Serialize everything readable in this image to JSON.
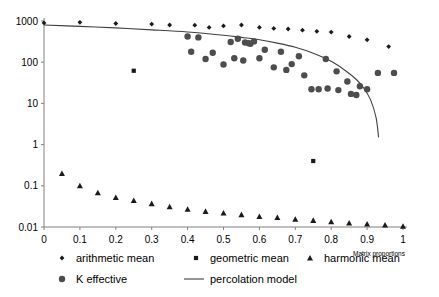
{
  "chart_data": {
    "type": "scatter",
    "title": "",
    "subtitle": "",
    "xlabel": "Matrix proportions",
    "ylabel": "",
    "xlim": [
      0,
      1
    ],
    "ylim": [
      0.01,
      1000
    ],
    "yscale": "log",
    "xscale": "linear",
    "grid": false,
    "legend_position": "bottom",
    "xticks": [
      "0",
      "0.1",
      "0.2",
      "0.3",
      "0.4",
      "0.5",
      "0.6",
      "0.7",
      "0.8",
      "0.9",
      "1"
    ],
    "xtick_values": [
      0,
      0.1,
      0.2,
      0.3,
      0.4,
      0.5,
      0.6,
      0.7,
      0.8,
      0.9,
      1
    ],
    "yticks": [
      "1000",
      "100",
      "10",
      "1",
      "0.1",
      "0.01"
    ],
    "ytick_values": [
      1000,
      100,
      10,
      1,
      0.1,
      0.01
    ],
    "series": [
      {
        "name": "arithmetic mean",
        "marker": "diamond",
        "color": "#1a1a1a",
        "points": [
          {
            "x": 0.0,
            "y": 900
          },
          {
            "x": 0.1,
            "y": 930
          },
          {
            "x": 0.2,
            "y": 870
          },
          {
            "x": 0.3,
            "y": 840
          },
          {
            "x": 0.35,
            "y": 800
          },
          {
            "x": 0.42,
            "y": 790
          },
          {
            "x": 0.46,
            "y": 700
          },
          {
            "x": 0.5,
            "y": 760
          },
          {
            "x": 0.55,
            "y": 800
          },
          {
            "x": 0.6,
            "y": 700
          },
          {
            "x": 0.64,
            "y": 660
          },
          {
            "x": 0.68,
            "y": 640
          },
          {
            "x": 0.72,
            "y": 600
          },
          {
            "x": 0.76,
            "y": 560
          },
          {
            "x": 0.8,
            "y": 540
          },
          {
            "x": 0.85,
            "y": 420
          },
          {
            "x": 0.9,
            "y": 350
          },
          {
            "x": 0.96,
            "y": 240
          }
        ]
      },
      {
        "name": "geometric mean",
        "marker": "square",
        "color": "#1a1a1a",
        "points": [
          {
            "x": 0.25,
            "y": 62
          },
          {
            "x": 0.75,
            "y": 0.4
          }
        ]
      },
      {
        "name": "harmonic mean",
        "marker": "triangle",
        "color": "#1a1a1a",
        "points": [
          {
            "x": 0.05,
            "y": 0.2
          },
          {
            "x": 0.1,
            "y": 0.1
          },
          {
            "x": 0.15,
            "y": 0.068
          },
          {
            "x": 0.2,
            "y": 0.052
          },
          {
            "x": 0.25,
            "y": 0.044
          },
          {
            "x": 0.3,
            "y": 0.037
          },
          {
            "x": 0.35,
            "y": 0.031
          },
          {
            "x": 0.4,
            "y": 0.027
          },
          {
            "x": 0.45,
            "y": 0.024
          },
          {
            "x": 0.5,
            "y": 0.022
          },
          {
            "x": 0.55,
            "y": 0.02
          },
          {
            "x": 0.6,
            "y": 0.018
          },
          {
            "x": 0.65,
            "y": 0.017
          },
          {
            "x": 0.7,
            "y": 0.0155
          },
          {
            "x": 0.75,
            "y": 0.0145
          },
          {
            "x": 0.8,
            "y": 0.0135
          },
          {
            "x": 0.85,
            "y": 0.0125
          },
          {
            "x": 0.9,
            "y": 0.0118
          },
          {
            "x": 0.95,
            "y": 0.0112
          },
          {
            "x": 1.0,
            "y": 0.0105
          }
        ]
      },
      {
        "name": "K effective",
        "marker": "circle",
        "color": "#4d4d4d",
        "points": [
          {
            "x": 0.4,
            "y": 420
          },
          {
            "x": 0.43,
            "y": 400
          },
          {
            "x": 0.41,
            "y": 180
          },
          {
            "x": 0.45,
            "y": 120
          },
          {
            "x": 0.47,
            "y": 170
          },
          {
            "x": 0.5,
            "y": 88
          },
          {
            "x": 0.54,
            "y": 370
          },
          {
            "x": 0.56,
            "y": 300
          },
          {
            "x": 0.57,
            "y": 290
          },
          {
            "x": 0.575,
            "y": 280
          },
          {
            "x": 0.585,
            "y": 320
          },
          {
            "x": 0.52,
            "y": 310
          },
          {
            "x": 0.53,
            "y": 125
          },
          {
            "x": 0.555,
            "y": 110
          },
          {
            "x": 0.6,
            "y": 125
          },
          {
            "x": 0.615,
            "y": 200
          },
          {
            "x": 0.64,
            "y": 75
          },
          {
            "x": 0.66,
            "y": 180
          },
          {
            "x": 0.675,
            "y": 65
          },
          {
            "x": 0.69,
            "y": 90
          },
          {
            "x": 0.71,
            "y": 140
          },
          {
            "x": 0.725,
            "y": 48
          },
          {
            "x": 0.745,
            "y": 22
          },
          {
            "x": 0.765,
            "y": 22
          },
          {
            "x": 0.785,
            "y": 120
          },
          {
            "x": 0.79,
            "y": 23
          },
          {
            "x": 0.815,
            "y": 60
          },
          {
            "x": 0.82,
            "y": 21
          },
          {
            "x": 0.845,
            "y": 34
          },
          {
            "x": 0.855,
            "y": 17
          },
          {
            "x": 0.87,
            "y": 16
          },
          {
            "x": 0.88,
            "y": 26
          },
          {
            "x": 0.9,
            "y": 22
          },
          {
            "x": 0.93,
            "y": 55
          },
          {
            "x": 0.975,
            "y": 55
          }
        ]
      }
    ],
    "model": {
      "name": "percolation model",
      "color": "#404040",
      "points": [
        {
          "x": 0.0,
          "y": 800
        },
        {
          "x": 0.1,
          "y": 740
        },
        {
          "x": 0.2,
          "y": 680
        },
        {
          "x": 0.3,
          "y": 610
        },
        {
          "x": 0.4,
          "y": 540
        },
        {
          "x": 0.5,
          "y": 450
        },
        {
          "x": 0.55,
          "y": 400
        },
        {
          "x": 0.6,
          "y": 350
        },
        {
          "x": 0.65,
          "y": 290
        },
        {
          "x": 0.7,
          "y": 230
        },
        {
          "x": 0.75,
          "y": 165
        },
        {
          "x": 0.8,
          "y": 105
        },
        {
          "x": 0.84,
          "y": 62
        },
        {
          "x": 0.87,
          "y": 38
        },
        {
          "x": 0.89,
          "y": 24
        },
        {
          "x": 0.91,
          "y": 12
        },
        {
          "x": 0.925,
          "y": 4.5
        },
        {
          "x": 0.932,
          "y": 1.5
        }
      ]
    },
    "legend": [
      {
        "label": "arithmetic mean",
        "marker": "diamond",
        "color": "#1a1a1a"
      },
      {
        "label": "geometric mean",
        "marker": "square",
        "color": "#1a1a1a"
      },
      {
        "label": "harmonic mean",
        "marker": "triangle",
        "color": "#1a1a1a"
      },
      {
        "label": "K effective",
        "marker": "circle",
        "color": "#4d4d4d"
      },
      {
        "label": "percolation model",
        "marker": "line",
        "color": "#404040"
      }
    ]
  }
}
